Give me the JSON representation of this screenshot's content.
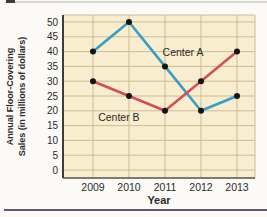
{
  "page": {
    "background": "#fbfaf7",
    "top_rule_color": "#d8d6d0",
    "corner_mark_color": "#3a3a3a",
    "bottom_rule_color": "#5e5774"
  },
  "chart_data": {
    "type": "line",
    "title": "",
    "xlabel": "Year",
    "ylabel": "Annual Floor-Covering Sales (in millions of dollars)",
    "ylabel_lines": [
      "Annual Floor-Covering",
      "Sales (in millions of dollars)"
    ],
    "categories": [
      "2009",
      "2010",
      "2011",
      "2012",
      "2013"
    ],
    "series": [
      {
        "name": "Center A",
        "color": "#3b9cc4",
        "values": [
          40,
          50,
          35,
          20,
          25
        ]
      },
      {
        "name": "Center B",
        "color": "#d24f57",
        "values": [
          30,
          25,
          20,
          30,
          40
        ]
      }
    ],
    "annotations": [
      {
        "text": "Center A",
        "x_index": 2.5,
        "value": 38.5
      },
      {
        "text": "Center B",
        "x_index": 0.72,
        "value": 16.5
      }
    ],
    "ylim": [
      0,
      50
    ],
    "ytick_step": 5,
    "yticks": [
      0,
      5,
      10,
      15,
      20,
      25,
      30,
      35,
      40,
      45,
      50
    ],
    "grid": true,
    "legend": "inline-labels",
    "point_color": "#141414",
    "plot_bg": "#f9edd0",
    "grid_color": "#cbbc97",
    "axis_color": "#403d38",
    "bottom_axis_color": "#56514b",
    "text_color": "#2b2a26"
  }
}
